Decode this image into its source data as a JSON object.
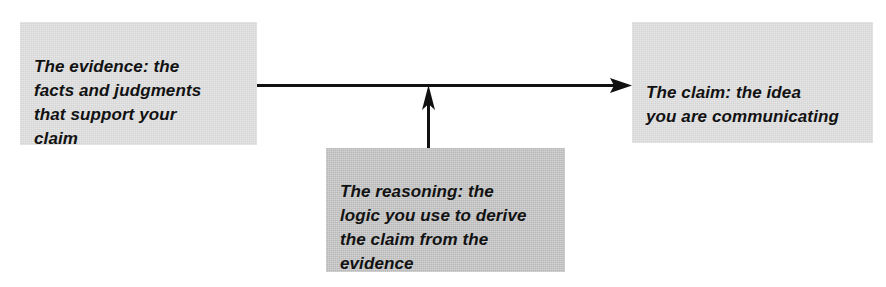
{
  "diagram": {
    "background_color": "#ffffff",
    "nodes": [
      {
        "id": "evidence",
        "role": "premise",
        "text": "The evidence: the\nfacts and judgments\nthat support your\nclaim",
        "lines": [
          "The evidence: the",
          "facts and judgments",
          "that support your",
          "claim"
        ],
        "fill_color": "#dcdcdc",
        "text_color": "#121212"
      },
      {
        "id": "claim",
        "role": "conclusion",
        "text": "The claim: the idea\nyou are communicating",
        "lines": [
          "The claim: the idea",
          "you are communicating"
        ],
        "fill_color": "#dcdcdc",
        "text_color": "#121212"
      },
      {
        "id": "reasoning",
        "role": "warrant",
        "text": "The reasoning: the\nlogic you use to derive\nthe claim from the\nevidence",
        "lines": [
          "The reasoning: the",
          "logic you use to derive",
          "the claim from the",
          "evidence"
        ],
        "fill_color": "#bfbfbf",
        "text_color": "#121212"
      }
    ],
    "connectors": [
      {
        "id": "evidence-to-claim",
        "from": "evidence",
        "to": "claim",
        "direction": "horizontal-right",
        "arrowhead": "solid-triangle",
        "color": "#111111"
      },
      {
        "id": "reasoning-to-link",
        "from": "reasoning",
        "to": "evidence-to-claim",
        "direction": "vertical-up",
        "arrowhead": "solid-narrow-triangle",
        "color": "#111111"
      }
    ]
  }
}
